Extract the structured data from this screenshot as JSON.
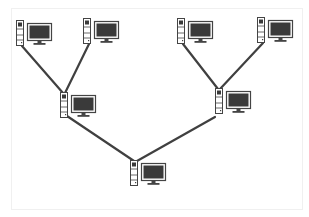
{
  "diagram": {
    "type": "tree-network-topology",
    "colors": {
      "line": "#404040",
      "screen": "#3a3a3a",
      "outline": "#444444",
      "background": "#ffffff"
    },
    "nodes": [
      {
        "id": "leaf-1",
        "level": "leaf",
        "x": 16,
        "y": 20
      },
      {
        "id": "leaf-2",
        "level": "leaf",
        "x": 83,
        "y": 18
      },
      {
        "id": "leaf-3",
        "level": "leaf",
        "x": 177,
        "y": 18
      },
      {
        "id": "leaf-4",
        "level": "leaf",
        "x": 257,
        "y": 17
      },
      {
        "id": "mid-left",
        "level": "branch",
        "x": 60,
        "y": 92
      },
      {
        "id": "mid-right",
        "level": "branch",
        "x": 215,
        "y": 88
      },
      {
        "id": "root",
        "level": "root",
        "x": 130,
        "y": 160
      }
    ],
    "links": [
      {
        "from": "leaf-1",
        "to": "mid-left",
        "x1": 22,
        "y1": 46,
        "x2": 63,
        "y2": 93
      },
      {
        "from": "leaf-2",
        "to": "mid-left",
        "x1": 89,
        "y1": 44,
        "x2": 65,
        "y2": 93
      },
      {
        "from": "leaf-3",
        "to": "mid-right",
        "x1": 183,
        "y1": 44,
        "x2": 218,
        "y2": 89
      },
      {
        "from": "leaf-4",
        "to": "mid-right",
        "x1": 263,
        "y1": 43,
        "x2": 220,
        "y2": 89
      },
      {
        "from": "mid-left",
        "to": "root",
        "x1": 67,
        "y1": 116,
        "x2": 134,
        "y2": 161
      },
      {
        "from": "mid-right",
        "to": "root",
        "x1": 215,
        "y1": 117,
        "x2": 137,
        "y2": 161
      }
    ]
  }
}
